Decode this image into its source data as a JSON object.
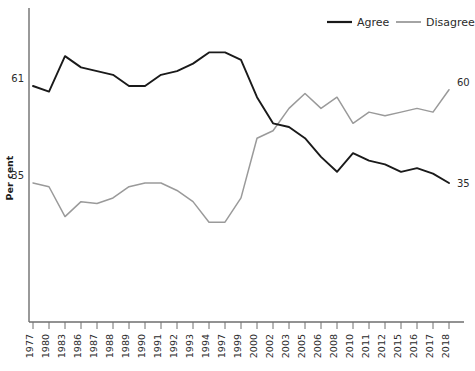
{
  "chart_data": {
    "type": "line",
    "title": "",
    "xlabel": "",
    "ylabel": "Per cent",
    "grid": false,
    "legend_position": "top-right",
    "x": [
      "1977",
      "1980",
      "1983",
      "1986",
      "1987",
      "1988",
      "1989",
      "1990",
      "1991",
      "1992",
      "1993",
      "1994",
      "1997",
      "1999",
      "2000",
      "2002",
      "2003",
      "2005",
      "2006",
      "2008",
      "2010",
      "2011",
      "2012",
      "2015",
      "2016",
      "2017",
      "2018"
    ],
    "xlim": [
      0,
      26
    ],
    "ylim": [
      0,
      100
    ],
    "series": [
      {
        "name": "Agree",
        "color": "#1a1a1a",
        "values": [
          61,
          59.5,
          69,
          66,
          65,
          64,
          61,
          61,
          64,
          65,
          67,
          70,
          70,
          68,
          58,
          51,
          50,
          47,
          42,
          38,
          43,
          41,
          40,
          38,
          39,
          37.5,
          35
        ]
      },
      {
        "name": "Disagree",
        "color": "#9a9a9a",
        "values": [
          35,
          34,
          26,
          30,
          29.5,
          31,
          34,
          35,
          35,
          33,
          30,
          24.5,
          24.5,
          31,
          47,
          49,
          55,
          59,
          55,
          58,
          51,
          54,
          53,
          54,
          55,
          54,
          60
        ]
      }
    ],
    "point_labels": {
      "agree_start": "61",
      "agree_end": "35",
      "disagree_start": "35",
      "disagree_end": "60"
    }
  },
  "legend": {
    "items": [
      {
        "label": "Agree",
        "color": "#1a1a1a"
      },
      {
        "label": "Disagree",
        "color": "#9a9a9a"
      }
    ]
  },
  "axis": {
    "y_title": "Per cent"
  }
}
